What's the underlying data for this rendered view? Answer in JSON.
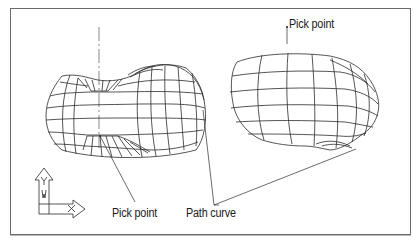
{
  "figure": {
    "labels": {
      "pick_point_top": "Pick point",
      "pick_point_bottom": "Pick point",
      "path_curve": "Path curve"
    },
    "ucs_icon": {
      "y_axis": "Y",
      "x_axis": "X",
      "w_marker": "W"
    },
    "colors": {
      "line": "#2b2b2b",
      "frame": "#6a6a6a",
      "background": "#ffffff"
    }
  }
}
